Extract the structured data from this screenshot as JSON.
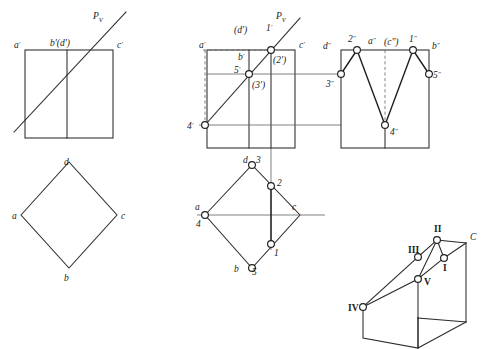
{
  "figure": {
    "canvas": {
      "width": 482,
      "height": 349
    },
    "colors": {
      "line": "#2b2b2b",
      "thin_line": "#555555",
      "heavy_line": "#1f1f1f",
      "dashed_line": "#666666",
      "node_fill": "#ffffff",
      "background": "#ffffff",
      "text": "#1a1a1a"
    },
    "views": {
      "left_front": {
        "name": "Left front view (given)",
        "labels": [
          {
            "id": "a-prime",
            "text": "a",
            "prime": "'",
            "x": 14,
            "y": 45
          },
          {
            "id": "b-prime-d-prime",
            "text": "b'(d')",
            "x": 53,
            "y": 45
          },
          {
            "id": "c-prime",
            "text": "c",
            "prime": "'",
            "x": 119,
            "y": 45
          },
          {
            "id": "pv-trace",
            "text": "P",
            "sub": "V",
            "x": 96,
            "y": 16
          }
        ]
      },
      "left_top": {
        "name": "Left top view (given)",
        "labels": [
          {
            "id": "d",
            "text": "d",
            "x": 66,
            "y": 166
          },
          {
            "id": "a",
            "text": "a",
            "x": 16,
            "y": 218
          },
          {
            "id": "c",
            "text": "c",
            "x": 116,
            "y": 218
          },
          {
            "id": "b",
            "text": "b",
            "x": 66,
            "y": 277
          }
        ]
      },
      "middle_front": {
        "name": "Front view with section points",
        "labels": [
          {
            "id": "a-prime",
            "text": "a",
            "prime": "'",
            "x": 200,
            "y": 45
          },
          {
            "id": "d-prime-hidden",
            "text": "(d')",
            "x": 237,
            "y": 33
          },
          {
            "id": "one-prime",
            "text": "1",
            "prime": "'",
            "x": 267,
            "y": 33
          },
          {
            "id": "c-prime",
            "text": "c",
            "prime": "'",
            "x": 301,
            "y": 45
          },
          {
            "id": "b-prime",
            "text": "b",
            "prime": "'",
            "x": 240,
            "y": 58
          },
          {
            "id": "two-prime-hidden",
            "text": "(2')",
            "x": 276,
            "y": 60
          },
          {
            "id": "five-prime",
            "text": "5",
            "prime": "'",
            "x": 237,
            "y": 71
          },
          {
            "id": "three-prime-hidden",
            "text": "(3')",
            "x": 255,
            "y": 86
          },
          {
            "id": "four-prime",
            "text": "4",
            "prime": "'",
            "x": 190,
            "y": 128
          },
          {
            "id": "pv-trace",
            "text": "P",
            "sub": "V",
            "x": 278,
            "y": 16
          }
        ]
      },
      "middle_side": {
        "name": "Side view with section points",
        "labels": [
          {
            "id": "d-double-prime",
            "text": "d",
            "prime": "\"",
            "x": 327,
            "y": 47
          },
          {
            "id": "two-double-prime",
            "text": "2",
            "prime": "\"",
            "x": 349,
            "y": 40
          },
          {
            "id": "a-double-prime",
            "text": "a",
            "prime": "\"",
            "x": 370,
            "y": 42
          },
          {
            "id": "c-double-prime-hidden",
            "text": "(c\")",
            "x": 386,
            "y": 44
          },
          {
            "id": "one-double-prime",
            "text": "1",
            "prime": "\"",
            "x": 410,
            "y": 40
          },
          {
            "id": "b-double-prime",
            "text": "b",
            "prime": "\"",
            "x": 432,
            "y": 47
          },
          {
            "id": "three-double-prime",
            "text": "3",
            "prime": "\"",
            "x": 329,
            "y": 84
          },
          {
            "id": "five-double-prime",
            "text": "5",
            "prime": "\"",
            "x": 431,
            "y": 78
          },
          {
            "id": "four-double-prime",
            "text": "4",
            "prime": "\"",
            "x": 389,
            "y": 134
          }
        ]
      },
      "middle_top": {
        "name": "Top view with section points",
        "labels": [
          {
            "id": "d",
            "text": "d",
            "x": 245,
            "y": 164
          },
          {
            "id": "three",
            "text": "3",
            "x": 257,
            "y": 163
          },
          {
            "id": "two",
            "text": "2",
            "x": 278,
            "y": 188
          },
          {
            "id": "a",
            "text": "a",
            "x": 197,
            "y": 210
          },
          {
            "id": "four",
            "text": "4",
            "x": 199,
            "y": 225
          },
          {
            "id": "c",
            "text": "c",
            "x": 294,
            "y": 211
          },
          {
            "id": "one",
            "text": "1",
            "x": 277,
            "y": 252
          },
          {
            "id": "b",
            "text": "b",
            "x": 236,
            "y": 270
          },
          {
            "id": "five",
            "text": "5",
            "x": 253,
            "y": 271
          }
        ]
      },
      "pictorial": {
        "name": "Isometric pictorial view",
        "labels": [
          {
            "id": "point-I",
            "text": "I",
            "x": 441,
            "y": 251
          },
          {
            "id": "point-II",
            "text": "II",
            "x": 421,
            "y": 231
          },
          {
            "id": "point-III",
            "text": "III",
            "x": 407,
            "y": 246
          },
          {
            "id": "point-IV",
            "text": "IV",
            "x": 352,
            "y": 310
          },
          {
            "id": "point-V",
            "text": "V",
            "x": 430,
            "y": 286
          },
          {
            "id": "point-C",
            "text": "C",
            "x": 464,
            "y": 239
          }
        ]
      }
    },
    "geometry": {
      "left_front_rect": {
        "x": 25,
        "y": 50,
        "w": 88,
        "h": 88
      },
      "left_front_midline_x": 67,
      "left_front_trace": {
        "x1": 14,
        "y1": 130,
        "x2": 122,
        "y2": 14
      },
      "left_top_diamond": {
        "cx": 69,
        "cy": 215,
        "rx": 48,
        "ry": 53
      },
      "middle_front_rect": {
        "x": 207,
        "y": 50,
        "w": 88,
        "h": 98
      },
      "middle_side_rect": {
        "x": 341,
        "y": 50,
        "w": 88,
        "h": 98
      },
      "middle_top_diamond": {
        "cx": 252,
        "cy": 215,
        "rx": 48,
        "ry": 53
      }
    }
  }
}
